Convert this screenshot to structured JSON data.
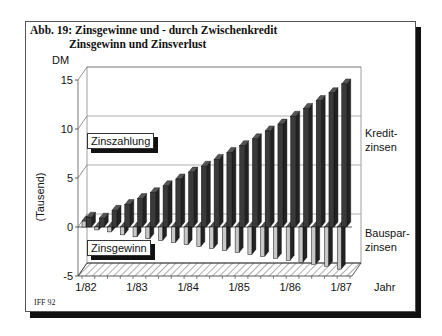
{
  "title": {
    "line1": "Abb. 19: Zinsgewinne und - durch Zwischenkredit",
    "line2": "Zinsgewinn und Zinsverlust"
  },
  "footer": "IFF 92",
  "labels": {
    "unit": "DM",
    "ylabel": "(Tausend)",
    "xunit": "Jahr",
    "zinszahlung": "Zinszahlung",
    "zinsgewinn": "Zinsgewinn",
    "kredit_line1": "Kredit-",
    "kredit_line2": "zinsen",
    "bauspar_line1": "Bauspar-",
    "bauspar_line2": "zinsen"
  },
  "colors": {
    "kredit": "#3a3a3a",
    "bauspar": "#c8c8c8",
    "grid": "#999999"
  },
  "chart_data": {
    "type": "bar",
    "xlabel": "Jahr",
    "ylabel": "DM (Tausend)",
    "ylim": [
      -5,
      15
    ],
    "yticks": [
      -5,
      0,
      5,
      10,
      15
    ],
    "x_tick_labels": [
      "1/82",
      "1/83",
      "1/84",
      "1/85",
      "1/86",
      "1/87"
    ],
    "grid": true,
    "three_d": true,
    "categories": [
      "1/82",
      "4/82",
      "7/82",
      "10/82",
      "1/83",
      "4/83",
      "7/83",
      "10/83",
      "1/84",
      "4/84",
      "7/84",
      "10/84",
      "1/85",
      "4/85",
      "7/85",
      "10/85",
      "1/86",
      "4/86",
      "7/86",
      "10/86",
      "1/87"
    ],
    "series": [
      {
        "name": "Kreditzinsen",
        "values": [
          1.0,
          0.9,
          1.7,
          2.3,
          2.9,
          3.5,
          4.2,
          4.9,
          5.6,
          6.2,
          6.9,
          7.6,
          8.3,
          9.0,
          9.8,
          10.5,
          11.3,
          12.1,
          12.9,
          13.7,
          14.6
        ]
      },
      {
        "name": "Bausparzinsen",
        "values": [
          0.6,
          -0.3,
          -0.5,
          -0.8,
          -1.0,
          -1.2,
          -1.4,
          -1.6,
          -1.8,
          -2.0,
          -2.2,
          -2.4,
          -2.6,
          -2.8,
          -3.0,
          -3.2,
          -3.4,
          -3.6,
          -3.8,
          -4.0,
          -4.3
        ]
      }
    ],
    "annotations": [
      "Zinszahlung",
      "Zinsgewinn",
      "Kredit-zinsen",
      "Bauspar-zinsen"
    ]
  }
}
